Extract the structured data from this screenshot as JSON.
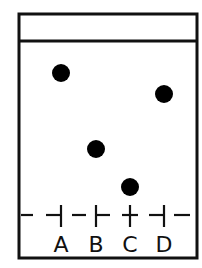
{
  "diagram": {
    "type": "thin-layer-chromatography-plate",
    "colors": {
      "stroke": "#111111",
      "spot": "#000000",
      "background": "#ffffff"
    },
    "plate": {
      "x": 19,
      "y": 14,
      "width": 178,
      "height": 244,
      "solvent_front_y": 41,
      "baseline_y": 215
    },
    "lanes": [
      {
        "label": "A",
        "x": 61,
        "spot": {
          "x": 61,
          "y": 73,
          "r": 9
        },
        "tick_side": "left"
      },
      {
        "label": "B",
        "x": 96,
        "spot": {
          "x": 96,
          "y": 149,
          "r": 9
        },
        "tick_side": "right"
      },
      {
        "label": "C",
        "x": 130,
        "spot": {
          "x": 130,
          "y": 187,
          "r": 9
        },
        "tick_side": "both"
      },
      {
        "label": "D",
        "x": 164,
        "spot": {
          "x": 164,
          "y": 94,
          "r": 9
        },
        "tick_side": "left"
      }
    ],
    "label_y": 252
  }
}
